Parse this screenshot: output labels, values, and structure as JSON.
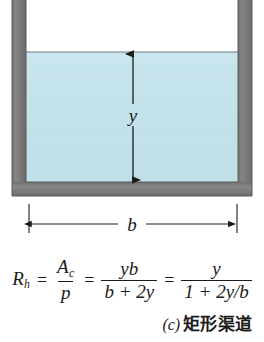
{
  "figure": {
    "type": "engineering-cross-section-diagram",
    "colors": {
      "wall": "#7c7c7c",
      "wall_edge": "#5d5d5d",
      "water": "#c6e3ec",
      "water_edge": "#6f7f86",
      "background": "#ffffff",
      "ink": "#1b1b1b"
    },
    "labels": {
      "depth": "y",
      "width": "b"
    },
    "dimensions": {
      "depth_label": "y",
      "width_label": "b"
    }
  },
  "formula": {
    "lhs": "R",
    "lhs_sub": "h",
    "eq1": "=",
    "term1_num": "A",
    "term1_num_sub": "c",
    "term1_den": "p",
    "eq2": "=",
    "term2_num": "yb",
    "term2_den": "b + 2y",
    "eq3": "=",
    "term3_num": "y",
    "term3_den": "1 + 2y/b",
    "plain": "R_h = A_c / p = yb / (b + 2y) = y / (1 + 2y/b)"
  },
  "caption": {
    "index": "(c)",
    "text": "矩形渠道",
    "full": "(c) 矩形渠道"
  }
}
